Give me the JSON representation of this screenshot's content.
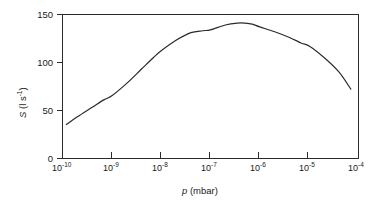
{
  "chart_data": {
    "type": "line",
    "title": "",
    "subtitle": "",
    "xlabel": "p (mbar)",
    "xlabel_symbol": "p",
    "xlabel_unit": "(mbar)",
    "ylabel": "S (l s⁻¹)",
    "ylabel_symbol": "S",
    "ylabel_unit": "(l s",
    "ylabel_exponent": "-1",
    "ylabel_unit_close": ")",
    "xscale": "log",
    "yscale": "linear",
    "xlim": [
      1e-10,
      0.0001
    ],
    "ylim": [
      0,
      150
    ],
    "grid": false,
    "legend": null,
    "x_tick_labels": [
      {
        "mantissa": "10",
        "exponent": "-10",
        "value": 1e-10
      },
      {
        "mantissa": "10",
        "exponent": "-9",
        "value": 1e-09
      },
      {
        "mantissa": "10",
        "exponent": "-8",
        "value": 1e-08
      },
      {
        "mantissa": "10",
        "exponent": "-7",
        "value": 1e-07
      },
      {
        "mantissa": "10",
        "exponent": "-6",
        "value": 1e-06
      },
      {
        "mantissa": "10",
        "exponent": "-5",
        "value": 1e-05
      },
      {
        "mantissa": "10",
        "exponent": "-4",
        "value": 0.0001
      }
    ],
    "y_tick_labels": [
      "0",
      "50",
      "100",
      "150"
    ],
    "y_tick_values": [
      0,
      50,
      100,
      150
    ],
    "series": [
      {
        "name": "pumping speed",
        "color": "#2b2b2b",
        "x": [
          1.2e-10,
          2e-10,
          4e-10,
          7e-10,
          1e-09,
          2e-09,
          4e-09,
          7e-09,
          1e-08,
          2e-08,
          4e-08,
          7e-08,
          1e-07,
          2e-07,
          3.5e-07,
          5e-07,
          7e-07,
          1e-06,
          2e-06,
          4e-06,
          7e-06,
          1e-05,
          2e-05,
          4e-05,
          7e-05
        ],
        "y": [
          35,
          43,
          53,
          61,
          65,
          78,
          93,
          105,
          112,
          123,
          131,
          133,
          134,
          139,
          141,
          141,
          140,
          137,
          132,
          126,
          120,
          117,
          105,
          90,
          72
        ]
      }
    ],
    "annotations": []
  },
  "axis": {
    "x_title_symbol": "p",
    "x_title_rest": " (mbar)",
    "y_title_symbol": "S",
    "y_title_rest_open": " (l s",
    "y_title_exp": "-1",
    "y_title_rest_close": ")"
  },
  "colors": {
    "background": "#ffffff",
    "axis": "#2b2b2b",
    "curve": "#2b2b2b",
    "text": "#1a1a1a"
  }
}
